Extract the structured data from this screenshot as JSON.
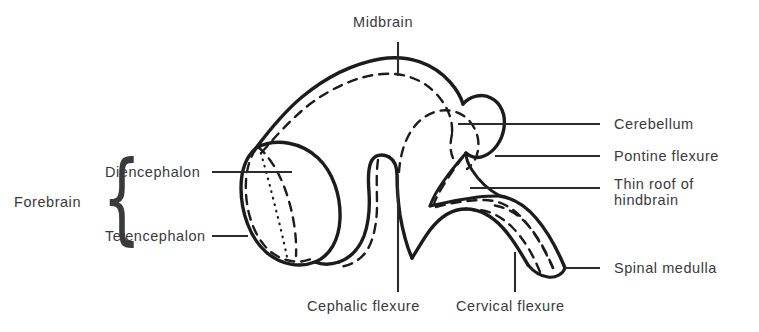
{
  "figure": {
    "ink_color": "#222222",
    "text_color": "#3a3a3a",
    "background": "#ffffff"
  },
  "labels": {
    "midbrain": "Midbrain",
    "forebrain": "Forebrain",
    "diencephalon": "Diencephalon",
    "telencephalon": "Telencephalon",
    "cerebellum": "Cerebellum",
    "pontine_flexure": "Pontine flexure",
    "thin_roof_line1": "Thin roof of",
    "thin_roof_line2": "hindbrain",
    "spinal_medulla": "Spinal medulla",
    "cephalic_flexure": "Cephalic flexure",
    "cervical_flexure": "Cervical flexure",
    "brace_glyph": "{"
  },
  "annotations": [
    {
      "name": "midbrain",
      "text": "Midbrain",
      "position": "top-center",
      "leader": "vertical"
    },
    {
      "name": "cerebellum",
      "text": "Cerebellum",
      "position": "right",
      "leader": "horizontal"
    },
    {
      "name": "pontine-flexure",
      "text": "Pontine flexure",
      "position": "right",
      "leader": "horizontal"
    },
    {
      "name": "thin-roof",
      "text": "Thin roof of hindbrain",
      "position": "right",
      "leader": "horizontal"
    },
    {
      "name": "spinal-medulla",
      "text": "Spinal medulla",
      "position": "right",
      "leader": "horizontal"
    },
    {
      "name": "diencephalon",
      "text": "Diencephalon",
      "position": "left",
      "leader": "horizontal"
    },
    {
      "name": "telencephalon",
      "text": "Telencephalon",
      "position": "left",
      "leader": "horizontal"
    },
    {
      "name": "forebrain",
      "text": "Forebrain",
      "position": "left",
      "leader": "brace"
    },
    {
      "name": "cephalic-flexure",
      "text": "Cephalic flexure",
      "position": "bottom",
      "leader": "vertical"
    },
    {
      "name": "cervical-flexure",
      "text": "Cervical flexure",
      "position": "bottom",
      "leader": "vertical"
    }
  ]
}
